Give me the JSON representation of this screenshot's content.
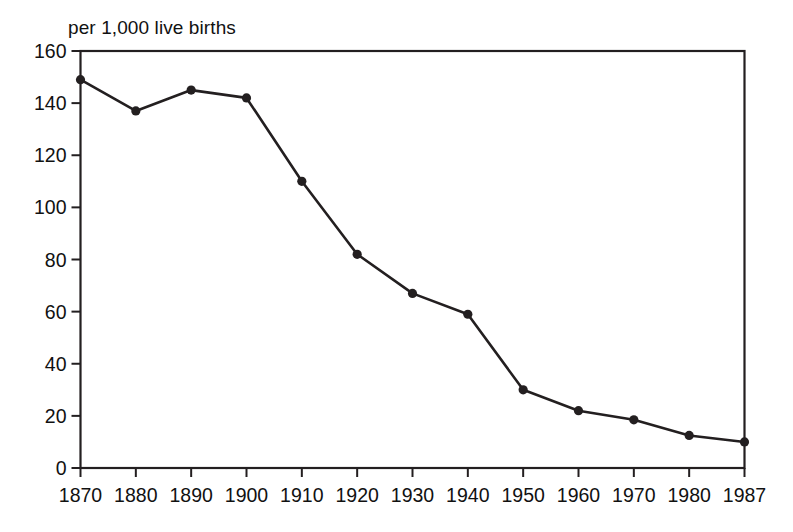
{
  "chart_data": {
    "type": "line",
    "title": "",
    "subtitle": "",
    "axis_note": "per 1,000 live births",
    "xlabel": "",
    "ylabel": "",
    "x": [
      "1870",
      "1880",
      "1890",
      "1900",
      "1910",
      "1920",
      "1930",
      "1940",
      "1950",
      "1960",
      "1970",
      "1980",
      "1987"
    ],
    "values": [
      149,
      137,
      145,
      142,
      110,
      82,
      67,
      59,
      30,
      22,
      18.5,
      12.5,
      10
    ],
    "series": [
      {
        "name": "Infant mortality rate",
        "values": [
          149,
          137,
          145,
          142,
          110,
          82,
          67,
          59,
          30,
          22,
          18.5,
          12.5,
          10
        ]
      }
    ],
    "xticks": [
      "1870",
      "1880",
      "1890",
      "1900",
      "1910",
      "1920",
      "1930",
      "1940",
      "1950",
      "1960",
      "1970",
      "1980",
      "1987"
    ],
    "yticks": [
      "0",
      "20",
      "40",
      "60",
      "80",
      "100",
      "120",
      "140",
      "160"
    ],
    "ytick_values": [
      0,
      20,
      40,
      60,
      80,
      100,
      120,
      140,
      160
    ],
    "xlim": [
      0,
      12
    ],
    "ylim": [
      0,
      160
    ],
    "grid": false,
    "legend": "none",
    "marker": "filled-circle",
    "line_color": "#231f20",
    "marker_color": "#231f20",
    "axis_color": "#231f20",
    "background_color": "#ffffff"
  },
  "chart": {
    "axis_note": "per 1,000 live births"
  }
}
